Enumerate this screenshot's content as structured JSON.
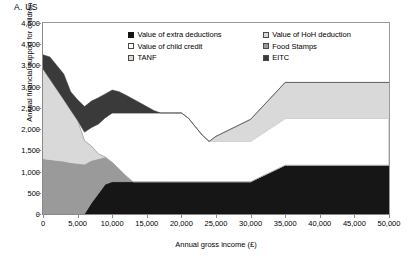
{
  "panel": {
    "title": "A.  US"
  },
  "axes": {
    "ylabel": "Annual financial support for children (£)",
    "xlabel": "Annual gross income (£)",
    "yticks": [
      "0",
      "500",
      "1,000",
      "1,500",
      "2,000",
      "2,500",
      "3,000",
      "3,500",
      "4,000",
      "4,500"
    ],
    "ytick_values": [
      0,
      500,
      1000,
      1500,
      2000,
      2500,
      3000,
      3500,
      4000,
      4500
    ],
    "xticks": [
      "0",
      "5,000",
      "10,000",
      "15,000",
      "20,000",
      "25,000",
      "30,000",
      "35,000",
      "40,000",
      "45,000",
      "50,000"
    ],
    "xtick_values": [
      0,
      5000,
      10000,
      15000,
      20000,
      25000,
      30000,
      35000,
      40000,
      45000,
      50000
    ]
  },
  "legend": {
    "items": [
      {
        "label": "Value of extra deductions",
        "swatch": "black",
        "color": "#161616"
      },
      {
        "label": "Value of HoH deduction",
        "swatch": "light",
        "color": "#d9d9d9"
      },
      {
        "label": "Value of child credit",
        "swatch": "white",
        "color": "#ffffff"
      },
      {
        "label": "Food Stamps",
        "swatch": "mid",
        "color": "#9a9a9a"
      },
      {
        "label": "TANF",
        "swatch": "light",
        "color": "#d9d9d9"
      },
      {
        "label": "EITC",
        "swatch": "dark",
        "color": "#161616"
      }
    ]
  },
  "chart_data": {
    "type": "area",
    "stacked": true,
    "title": "A.  US",
    "xlabel": "Annual gross income (£)",
    "ylabel": "Annual financial support for children (£)",
    "xlim": [
      0,
      50000
    ],
    "ylim": [
      0,
      4500
    ],
    "grid": false,
    "legend_position": "inside-top-right",
    "x": [
      0,
      1000,
      2000,
      3000,
      4000,
      5000,
      6000,
      7000,
      8000,
      9000,
      10000,
      11000,
      12000,
      13000,
      14000,
      15000,
      16000,
      17000,
      18000,
      19000,
      20000,
      21000,
      22000,
      23000,
      24000,
      25000,
      30000,
      35000,
      40000,
      45000,
      50000
    ],
    "series": [
      {
        "name": "EITC",
        "color": "#161616",
        "values": [
          0,
          0,
          0,
          0,
          0,
          0,
          0,
          260,
          480,
          700,
          760,
          760,
          760,
          760,
          760,
          760,
          760,
          760,
          760,
          760,
          760,
          760,
          760,
          760,
          760,
          760,
          760,
          1150,
          1150,
          1150,
          1150
        ]
      },
      {
        "name": "Food Stamps",
        "color": "#9a9a9a",
        "values": [
          1300,
          1280,
          1260,
          1240,
          1210,
          1190,
          1170,
          1000,
          820,
          640,
          460,
          300,
          140,
          0,
          0,
          0,
          0,
          0,
          0,
          0,
          0,
          0,
          0,
          0,
          0,
          0,
          0,
          0,
          0,
          0,
          0
        ]
      },
      {
        "name": "TANF",
        "color": "#d9d9d9",
        "values": [
          2120,
          1900,
          1680,
          1460,
          1240,
          1020,
          560,
          340,
          120,
          0,
          0,
          0,
          0,
          0,
          0,
          0,
          0,
          0,
          0,
          0,
          0,
          0,
          0,
          0,
          0,
          0,
          0,
          0,
          0,
          0,
          0
        ]
      },
      {
        "name": "Value of child credit",
        "color": "#ffffff",
        "values": [
          0,
          0,
          0,
          0,
          0,
          0,
          200,
          440,
          700,
          930,
          1160,
          1320,
          1480,
          1620,
          1620,
          1620,
          1620,
          1620,
          1620,
          1620,
          1620,
          1500,
          1300,
          1100,
          950,
          950,
          950,
          1100,
          1100,
          1100,
          1100
        ]
      },
      {
        "name": "Value of HoH deduction",
        "color": "#d9d9d9",
        "values": [
          0,
          0,
          0,
          0,
          0,
          0,
          0,
          0,
          0,
          0,
          0,
          0,
          0,
          0,
          0,
          0,
          0,
          0,
          0,
          0,
          0,
          0,
          0,
          0,
          0,
          120,
          520,
          850,
          850,
          850,
          850
        ]
      },
      {
        "name": "Value of extra deductions",
        "color": "#3a3a3a",
        "values": [
          330,
          520,
          560,
          600,
          430,
          480,
          600,
          620,
          620,
          560,
          540,
          500,
          420,
          330,
          240,
          150,
          60,
          0,
          0,
          0,
          0,
          0,
          0,
          0,
          0,
          0,
          0,
          0,
          0,
          0,
          0
        ]
      }
    ]
  }
}
